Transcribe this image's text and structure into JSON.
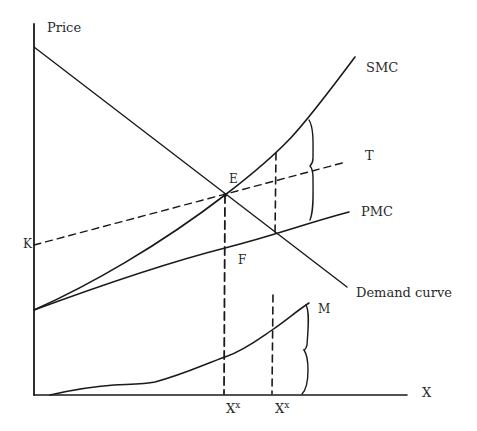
{
  "diagram": {
    "axes": {
      "y_label": "Price",
      "x_label": "X"
    },
    "curves": {
      "smc": "SMC",
      "pmc": "PMC",
      "tax_line": "T",
      "demand": "Demand curve",
      "external_cost": "M"
    },
    "points": {
      "k": "K",
      "e": "E",
      "f": "F"
    },
    "x_ticks": [
      {
        "base": "X",
        "sup": "x"
      },
      {
        "base": "X",
        "sup": "x"
      }
    ]
  }
}
